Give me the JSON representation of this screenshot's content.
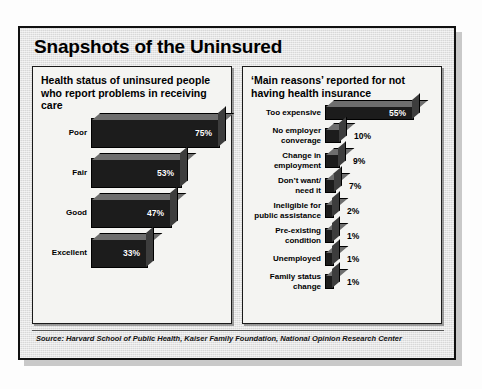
{
  "card": {
    "title": "Snapshots of the Uninsured",
    "source": "Source: Harvard School of Public Health, Kaiser Family Foundation, National Opinion Research Center"
  },
  "left_panel": {
    "title": "Health status of uninsured people who report problems in receiving care"
  },
  "right_panel": {
    "title": "‘Main reasons’ reported for not having health insurance"
  },
  "chart_data": [
    {
      "type": "bar",
      "title": "Health status of uninsured people who report problems in receiving care",
      "orientation": "horizontal",
      "xlabel": "",
      "ylabel": "",
      "xlim": [
        0,
        80
      ],
      "grid": false,
      "legend": false,
      "categories": [
        "Poor",
        "Fair",
        "Good",
        "Excellent"
      ],
      "values": [
        75,
        53,
        47,
        33
      ],
      "value_labels": [
        "75%",
        "53%",
        "47%",
        "33%"
      ],
      "rows": [
        {
          "label": "Poor",
          "label_lines": [
            "Poor"
          ],
          "value": 75,
          "value_label": "75%"
        },
        {
          "label": "Fair",
          "label_lines": [
            "Fair"
          ],
          "value": 53,
          "value_label": "53%"
        },
        {
          "label": "Good",
          "label_lines": [
            "Good"
          ],
          "value": 47,
          "value_label": "47%"
        },
        {
          "label": "Excellent",
          "label_lines": [
            "Excellent"
          ],
          "value": 33,
          "value_label": "33%"
        }
      ]
    },
    {
      "type": "bar",
      "title": "‘Main reasons’ reported for not having health insurance",
      "orientation": "horizontal",
      "xlabel": "",
      "ylabel": "",
      "xlim": [
        0,
        60
      ],
      "grid": false,
      "legend": false,
      "categories": [
        "Too expensive",
        "No employer converage",
        "Change in employment",
        "Don't want/ need it",
        "Ineligible for public assistance",
        "Pre-existing condition",
        "Unemployed",
        "Family status change"
      ],
      "values": [
        55,
        10,
        9,
        7,
        2,
        1,
        1,
        1
      ],
      "value_labels": [
        "55%",
        "10%",
        "9%",
        "7%",
        "2%",
        "1%",
        "1%",
        "1%"
      ],
      "rows": [
        {
          "label": "Too expensive",
          "label_lines": [
            "Too expensive"
          ],
          "value": 55,
          "value_label": "55%",
          "inside": true
        },
        {
          "label": "No employer converage",
          "label_lines": [
            "No employer",
            "converage"
          ],
          "value": 10,
          "value_label": "10%",
          "inside": false
        },
        {
          "label": "Change in employment",
          "label_lines": [
            "Change in",
            "employment"
          ],
          "value": 9,
          "value_label": "9%",
          "inside": false
        },
        {
          "label": "Don't want/ need it",
          "label_lines": [
            "Don’t want/",
            "need it"
          ],
          "value": 7,
          "value_label": "7%",
          "inside": false
        },
        {
          "label": "Ineligible for public assistance",
          "label_lines": [
            "Ineligible for",
            "public assistance"
          ],
          "value": 2,
          "value_label": "2%",
          "inside": false
        },
        {
          "label": "Pre-existing condition",
          "label_lines": [
            "Pre-existing",
            "condition"
          ],
          "value": 1,
          "value_label": "1%",
          "inside": false
        },
        {
          "label": "Unemployed",
          "label_lines": [
            "Unemployed"
          ],
          "value": 1,
          "value_label": "1%",
          "inside": false
        },
        {
          "label": "Family status change",
          "label_lines": [
            "Family status",
            "change"
          ],
          "value": 1,
          "value_label": "1%",
          "inside": false
        }
      ]
    }
  ],
  "colors": {
    "card_background": "#d8d8d8",
    "panel_background": "#f4f4f2",
    "bar_front": "#1c1c1c",
    "bar_top": "#6e6e6e",
    "bar_side": "#3d3d3d",
    "border": "#111111",
    "text": "#000000",
    "value_text_inside": "#ffffff"
  }
}
